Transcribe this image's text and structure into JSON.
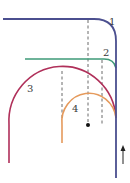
{
  "diagram": {
    "type": "path-diagram",
    "colors": {
      "path1": "#4b4f8f",
      "path2": "#3f9a78",
      "path3": "#b0305a",
      "path4": "#e59a5c",
      "dashed": "#444444",
      "arrow": "#222222"
    },
    "labels": {
      "l1": "1",
      "l2": "2",
      "l3": "3",
      "l4": "4"
    },
    "elements": [
      {
        "id": "path1",
        "label": "1",
        "description": "horizontal line turning down into vertical line at right"
      },
      {
        "id": "path2",
        "label": "2",
        "description": "horizontal line merging into vertical line"
      },
      {
        "id": "path3",
        "label": "3",
        "description": "large semicircular arc merging into vertical line"
      },
      {
        "id": "path4",
        "label": "4",
        "description": "small arc merging into vertical line"
      }
    ],
    "arrow_direction": "up",
    "center_point": "black dot"
  }
}
